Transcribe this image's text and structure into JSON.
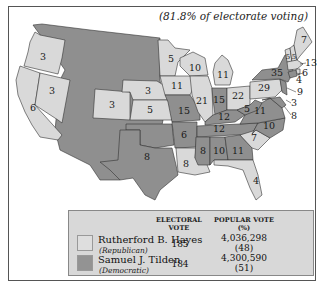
{
  "map": {
    "subtitle": "(81.8% of electorate voting)",
    "colors": {
      "republican": "#d9d9d9",
      "democratic": "#8f8f8f"
    },
    "states": [
      {
        "state": "Oregon",
        "votes": "3",
        "party": "republican"
      },
      {
        "state": "California",
        "votes": "6",
        "party": "republican"
      },
      {
        "state": "Nevada",
        "votes": "3",
        "party": "republican"
      },
      {
        "state": "Colorado",
        "votes": "3",
        "party": "republican"
      },
      {
        "state": "Nebraska",
        "votes": "3",
        "party": "republican"
      },
      {
        "state": "Kansas",
        "votes": "5",
        "party": "republican"
      },
      {
        "state": "Minnesota",
        "votes": "5",
        "party": "republican"
      },
      {
        "state": "Iowa",
        "votes": "11",
        "party": "republican"
      },
      {
        "state": "Wisconsin",
        "votes": "10",
        "party": "republican"
      },
      {
        "state": "Michigan",
        "votes": "11",
        "party": "republican"
      },
      {
        "state": "Illinois",
        "votes": "21",
        "party": "republican"
      },
      {
        "state": "Ohio",
        "votes": "22",
        "party": "republican"
      },
      {
        "state": "Pennsylvania",
        "votes": "29",
        "party": "republican"
      },
      {
        "state": "Maine",
        "votes": "7",
        "party": "republican"
      },
      {
        "state": "Vermont",
        "votes": "5",
        "party": "republican"
      },
      {
        "state": "New Hampshire",
        "votes": "5",
        "party": "republican"
      },
      {
        "state": "Massachusetts",
        "votes": "13",
        "party": "republican"
      },
      {
        "state": "Rhode Island",
        "votes": "4",
        "party": "republican"
      },
      {
        "state": "Louisiana",
        "votes": "8",
        "party": "republican"
      },
      {
        "state": "South Carolina",
        "votes": "7",
        "party": "republican"
      },
      {
        "state": "Florida",
        "votes": "4",
        "party": "republican"
      },
      {
        "state": "Texas",
        "votes": "8",
        "party": "democratic"
      },
      {
        "state": "Missouri",
        "votes": "15",
        "party": "democratic"
      },
      {
        "state": "Arkansas",
        "votes": "6",
        "party": "democratic"
      },
      {
        "state": "Mississippi",
        "votes": "8",
        "party": "democratic"
      },
      {
        "state": "Alabama",
        "votes": "10",
        "party": "democratic"
      },
      {
        "state": "Georgia",
        "votes": "11",
        "party": "democratic"
      },
      {
        "state": "Tennessee",
        "votes": "12",
        "party": "democratic"
      },
      {
        "state": "Kentucky",
        "votes": "12",
        "party": "democratic"
      },
      {
        "state": "Indiana",
        "votes": "15",
        "party": "democratic"
      },
      {
        "state": "West Virginia",
        "votes": "5",
        "party": "democratic"
      },
      {
        "state": "Virginia",
        "votes": "11",
        "party": "democratic"
      },
      {
        "state": "North Carolina",
        "votes": "10",
        "party": "democratic"
      },
      {
        "state": "New York",
        "votes": "35",
        "party": "democratic"
      },
      {
        "state": "New Jersey",
        "votes": "9",
        "party": "democratic"
      },
      {
        "state": "Delaware",
        "votes": "3",
        "party": "democratic"
      },
      {
        "state": "Maryland",
        "votes": "8",
        "party": "democratic"
      },
      {
        "state": "Connecticut",
        "votes": "6",
        "party": "democratic"
      }
    ]
  },
  "legend": {
    "col_electoral": "ELECTORAL",
    "col_electoral_2": "VOTE",
    "col_popular": "POPULAR VOTE",
    "col_popular_2": "(%)",
    "rows": [
      {
        "candidate": "Rutherford B. Hayes",
        "party": "(Republican)",
        "electoral": "185",
        "popular": "4,036,298",
        "percent": "(48)"
      },
      {
        "candidate": "Samuel J. Tilden",
        "party": "(Democratic)",
        "electoral": "184",
        "popular": "4,300,590",
        "percent": "(51)"
      }
    ]
  }
}
